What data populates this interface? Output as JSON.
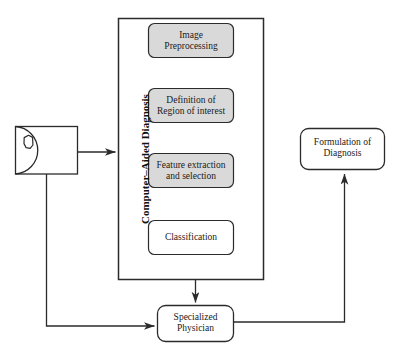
{
  "diagram": {
    "container_label": "Computer–Aided Diagnosis",
    "colors": {
      "stroke": "#2b2b2b",
      "step_fill": "#d9d9d9",
      "plain_fill": "#ffffff",
      "background": "#ffffff",
      "text": "#1a1a1a"
    },
    "source_node": {
      "name": "imaging-device",
      "shape": "square-with-semicircle",
      "label": ""
    },
    "steps": [
      {
        "label": "Image\nPreprocessing",
        "fill": "#d9d9d9"
      },
      {
        "label": "Definition of\nRegion of interest",
        "fill": "#d9d9d9"
      },
      {
        "label": "Feature extraction\nand selection",
        "fill": "#d9d9d9"
      },
      {
        "label": "Classification",
        "fill": "#ffffff"
      }
    ],
    "nodes": [
      {
        "key": "physician",
        "label": "Specialized\nPhysician"
      },
      {
        "key": "formulation",
        "label": "Formulation of\nDiagnosis"
      }
    ],
    "edges": [
      {
        "from": "imaging-device",
        "to": "cad-container",
        "arrow": true
      },
      {
        "from": "cad-container",
        "to": "physician",
        "arrow": true
      },
      {
        "from": "imaging-device",
        "to": "physician",
        "arrow": true
      },
      {
        "from": "physician",
        "to": "formulation",
        "arrow": true
      }
    ]
  }
}
